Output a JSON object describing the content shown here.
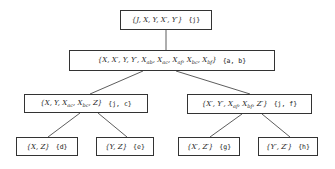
{
  "diagram": {
    "type": "tree",
    "nodes": [
      {
        "id": "root",
        "set": "{J, X, Y, X′, Y′}",
        "label": "{j}"
      },
      {
        "id": "n1",
        "set": "{X, X′, Y, Y′, X_ab, X_ac, X_af, X_bc, X_bf}",
        "label": "{a, b}"
      },
      {
        "id": "n2",
        "set": "{X, Y, X_ac, X_bc, Z}",
        "label": "{j, c}"
      },
      {
        "id": "n3",
        "set": "{X′, Y′, X_af, X_bf, Z′}",
        "label": "{j, f}"
      },
      {
        "id": "n4",
        "set": "{X, Z}",
        "label": "{d}"
      },
      {
        "id": "n5",
        "set": "{Y, Z}",
        "label": "{e}"
      },
      {
        "id": "n6",
        "set": "{X′, Z′}",
        "label": "{g}"
      },
      {
        "id": "n7",
        "set": "{Y′, Z′}",
        "label": "{h}"
      }
    ],
    "edges": [
      [
        "root",
        "n1"
      ],
      [
        "n1",
        "n2"
      ],
      [
        "n1",
        "n3"
      ],
      [
        "n2",
        "n4"
      ],
      [
        "n2",
        "n5"
      ],
      [
        "n3",
        "n6"
      ],
      [
        "n3",
        "n7"
      ]
    ],
    "colors": {
      "line": "#333333",
      "background": "#ffffff"
    }
  },
  "text": {
    "root_set": "{J, X, Y, X′, Y′}",
    "root_label": "{j}",
    "n1_prefix": "{X, X′, Y, Y′, X",
    "n1_label": "{a, b}",
    "n2_label": "{j, c}",
    "n3_label": "{j, f}",
    "n4_set": "{X, Z}",
    "n4_label": "{d}",
    "n5_set": "{Y, Z}",
    "n5_label": "{e}",
    "n6_set": "{X′, Z′}",
    "n6_label": "{g}",
    "n7_set": "{Y′, Z′}",
    "n7_label": "{h}"
  }
}
